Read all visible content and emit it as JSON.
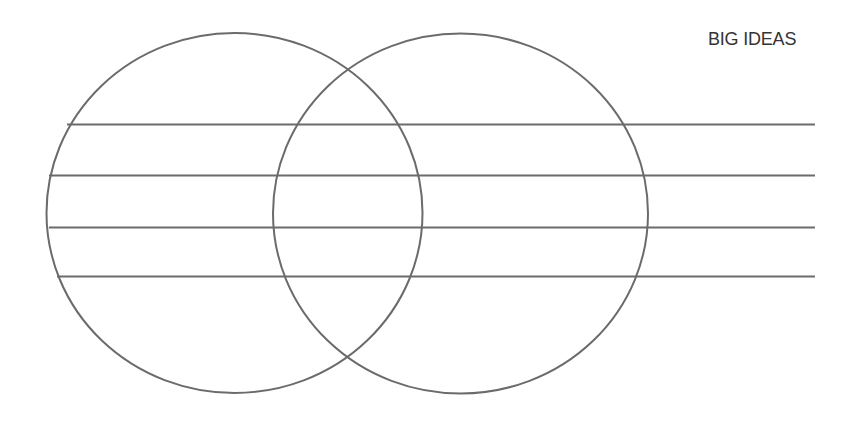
{
  "title": "BIG IDEAS",
  "colors": {
    "stroke": "#6b6b6b",
    "text": "#333333",
    "background": "#ffffff"
  },
  "diagram": {
    "type": "venn-with-writing-lines",
    "circles": [
      {
        "name": "left-circle",
        "cx": 234.5,
        "cy": 213,
        "rx": 188,
        "ry": 180
      },
      {
        "name": "right-circle",
        "cx": 460.5,
        "cy": 213.5,
        "rx": 187.5,
        "ry": 180
      }
    ],
    "lines": [
      {
        "name": "writing-line-1",
        "y": 124.5,
        "x1": 67,
        "x2": 815
      },
      {
        "name": "writing-line-2",
        "y": 175.5,
        "x1": 49,
        "x2": 815
      },
      {
        "name": "writing-line-3",
        "y": 227.5,
        "x1": 49,
        "x2": 815
      },
      {
        "name": "writing-line-4",
        "y": 276.5,
        "x1": 57,
        "x2": 815
      }
    ],
    "stroke_width": 2
  }
}
